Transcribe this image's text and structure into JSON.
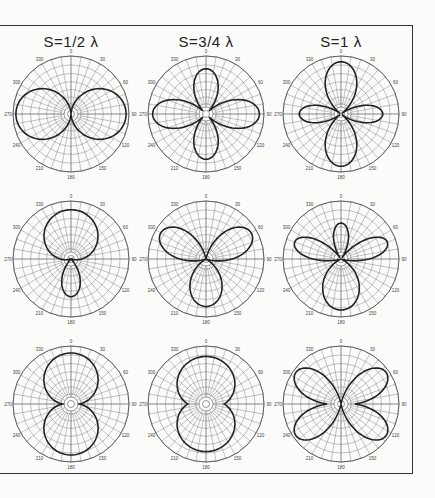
{
  "figure": {
    "column_titles": [
      "S=1/2 λ",
      "S=3/4 λ",
      "S=1 λ"
    ],
    "angle_labels": [
      "0",
      "30",
      "60",
      "90",
      "120",
      "150",
      "180",
      "210",
      "240",
      "270",
      "300",
      "330"
    ],
    "colors": {
      "ink": "#222222",
      "grid": "#555555",
      "paper": "#fbfbfa"
    }
  },
  "chart_data": {
    "type": "polar",
    "title": "",
    "grid": true,
    "angle_ticks_deg": [
      0,
      30,
      60,
      90,
      120,
      150,
      180,
      210,
      240,
      270,
      300,
      330
    ],
    "layout": {
      "rows": 3,
      "cols": 3
    },
    "columns": [
      "S=1/2 λ",
      "S=3/4 λ",
      "S=1 λ"
    ],
    "patterns": [
      {
        "row": 0,
        "col": 0,
        "spacing": "1/2 λ",
        "shape": "figure-eight, lobes at 90° and 270°",
        "lobes": [
          {
            "dir": 90,
            "r": 0.95,
            "w": 1.0
          },
          {
            "dir": 270,
            "r": 0.95,
            "w": 1.0
          }
        ]
      },
      {
        "row": 0,
        "col": 1,
        "spacing": "3/4 λ",
        "shape": "four lobes (cloverleaf)",
        "lobes": [
          {
            "dir": 0,
            "r": 0.78,
            "w": 0.55
          },
          {
            "dir": 90,
            "r": 0.92,
            "w": 0.55
          },
          {
            "dir": 180,
            "r": 0.78,
            "w": 0.55
          },
          {
            "dir": 270,
            "r": 0.92,
            "w": 0.55
          }
        ]
      },
      {
        "row": 0,
        "col": 2,
        "spacing": "1 λ",
        "shape": "four lobes, larger at 0° and 180°",
        "lobes": [
          {
            "dir": 0,
            "r": 0.9,
            "w": 0.62
          },
          {
            "dir": 90,
            "r": 0.72,
            "w": 0.42
          },
          {
            "dir": 180,
            "r": 0.9,
            "w": 0.62
          },
          {
            "dir": 270,
            "r": 0.72,
            "w": 0.42
          }
        ]
      },
      {
        "row": 1,
        "col": 0,
        "spacing": "1/2 λ",
        "shape": "cardioid-like, major lobe forward with rear lobe",
        "lobes": [
          {
            "dir": 0,
            "r": 0.85,
            "w": 1.25
          },
          {
            "dir": 180,
            "r": 0.65,
            "w": 0.5
          }
        ]
      },
      {
        "row": 1,
        "col": 1,
        "spacing": "3/4 λ",
        "shape": "three lobes",
        "lobes": [
          {
            "dir": 300,
            "r": 0.9,
            "w": 0.55
          },
          {
            "dir": 60,
            "r": 0.9,
            "w": 0.55
          },
          {
            "dir": 180,
            "r": 0.82,
            "w": 0.7
          }
        ]
      },
      {
        "row": 1,
        "col": 2,
        "spacing": "1 λ",
        "shape": "four lobes, large rear lobe",
        "lobes": [
          {
            "dir": 0,
            "r": 0.62,
            "w": 0.42
          },
          {
            "dir": 290,
            "r": 0.85,
            "w": 0.4
          },
          {
            "dir": 70,
            "r": 0.85,
            "w": 0.4
          },
          {
            "dir": 180,
            "r": 0.88,
            "w": 0.75
          }
        ]
      },
      {
        "row": 2,
        "col": 0,
        "spacing": "1/2 λ",
        "shape": "figure-eight, lobes at 0° and 180°",
        "lobes": [
          {
            "dir": 0,
            "r": 0.88,
            "w": 1.2
          },
          {
            "dir": 180,
            "r": 0.88,
            "w": 1.2
          }
        ]
      },
      {
        "row": 2,
        "col": 1,
        "spacing": "3/4 λ",
        "shape": "broad figure-eight, lobes at 0° and 180°",
        "lobes": [
          {
            "dir": 0,
            "r": 0.82,
            "w": 1.45
          },
          {
            "dir": 180,
            "r": 0.82,
            "w": 1.45
          }
        ]
      },
      {
        "row": 2,
        "col": 2,
        "spacing": "1 λ",
        "shape": "four lobes at 45° diagonals",
        "lobes": [
          {
            "dir": 55,
            "r": 0.95,
            "w": 0.5
          },
          {
            "dir": 125,
            "r": 0.95,
            "w": 0.5
          },
          {
            "dir": 235,
            "r": 0.95,
            "w": 0.5
          },
          {
            "dir": 305,
            "r": 0.95,
            "w": 0.5
          }
        ]
      }
    ]
  }
}
